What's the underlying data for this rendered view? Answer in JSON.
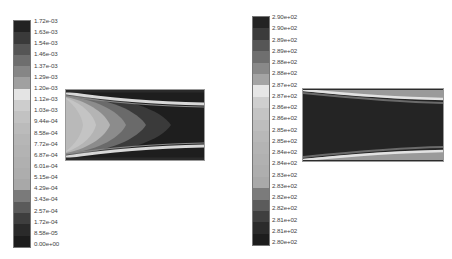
{
  "chart_data": [
    {
      "type": "heatmap",
      "title": "",
      "description": "Grayscale contour plot of a channel flow field (left panel); parabolic-shaped contour fronts near inlet, bright thin boundary layers near top and bottom walls",
      "colorbar": {
        "position": "left",
        "ticks": [
          "1.72e-03",
          "1.63e-03",
          "1.54e-03",
          "1.46e-03",
          "1.37e-03",
          "1.29e-03",
          "1.20e-03",
          "1.12e-03",
          "1.03e-03",
          "9.44e-04",
          "8.58e-04",
          "7.72e-04",
          "6.87e-04",
          "6.01e-04",
          "5.15e-04",
          "4.29e-04",
          "3.43e-04",
          "2.57e-04",
          "1.72e-04",
          "8.58e-05",
          "0.00e+00"
        ],
        "range": [
          0.0,
          0.00172
        ],
        "bands": [
          "#222222",
          "#3a3a3a",
          "#555555",
          "#6e6e6e",
          "#868686",
          "#a0a0a0",
          "#e4e4e4",
          "#cdcdcd",
          "#c2c2c2",
          "#bbbbbb",
          "#b6b6b6",
          "#b3b3b3",
          "#b0b0b0",
          "#adadad",
          "#a8a8a8",
          "#7a7a7a",
          "#5a5a5a",
          "#3e3e3e",
          "#2a2a2a",
          "#1c1c1c"
        ]
      }
    },
    {
      "type": "heatmap",
      "title": "",
      "description": "Grayscale contour plot of a channel temperature field (right panel); dark core region, bright thin layers along top and bottom walls converging slightly downstream",
      "colorbar": {
        "position": "left",
        "ticks": [
          "2.90e+02",
          "2.90e+02",
          "2.89e+02",
          "2.89e+02",
          "2.88e+02",
          "2.88e+02",
          "2.87e+02",
          "2.87e+02",
          "2.86e+02",
          "2.86e+02",
          "2.85e+02",
          "2.85e+02",
          "2.84e+02",
          "2.84e+02",
          "2.83e+02",
          "2.83e+02",
          "2.82e+02",
          "2.82e+02",
          "2.81e+02",
          "2.81e+02",
          "2.80e+02"
        ],
        "range": [
          280,
          290
        ],
        "bands": [
          "#232323",
          "#3b3b3b",
          "#565656",
          "#6f6f6f",
          "#898989",
          "#a4a4a4",
          "#e6e6e6",
          "#cfcfcf",
          "#c4c4c4",
          "#bdbdbd",
          "#b8b8b8",
          "#b4b4b4",
          "#b1b1b1",
          "#aeaeae",
          "#a9a9a9",
          "#7b7b7b",
          "#5b5b5b",
          "#3f3f3f",
          "#2b2b2b",
          "#1d1d1d"
        ]
      }
    }
  ]
}
